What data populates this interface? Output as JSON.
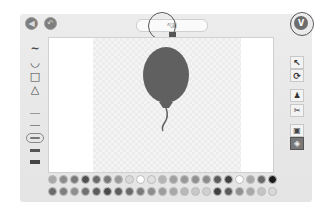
{
  "app": {
    "title_field": {
      "value": "气球"
    },
    "top_buttons": [
      {
        "name": "back-button",
        "icon": "back-icon"
      },
      {
        "name": "undo-button",
        "icon": "undo-icon"
      }
    ],
    "confirm_button": {
      "label": "V",
      "icon": "checkmark-icon"
    }
  },
  "left_tools": [
    {
      "name": "curve-tool",
      "icon": "curve-icon",
      "glyph": "∼"
    },
    {
      "name": "circle-tool",
      "icon": "circle-icon",
      "glyph": "◡"
    },
    {
      "name": "rectangle-tool",
      "icon": "rectangle-icon",
      "glyph": "□"
    },
    {
      "name": "triangle-tool",
      "icon": "triangle-icon",
      "glyph": "△"
    },
    {
      "name": "stroke-thin",
      "icon": "line-thin-icon"
    },
    {
      "name": "stroke-light",
      "icon": "line-light-icon"
    },
    {
      "name": "stroke-selected",
      "icon": "line-medium-icon"
    },
    {
      "name": "stroke-thick",
      "icon": "line-thick-icon"
    },
    {
      "name": "stroke-heavy",
      "icon": "line-heavy-icon"
    }
  ],
  "right_tools": [
    {
      "name": "select-tool",
      "icon": "cursor-icon",
      "glyph": "↖"
    },
    {
      "name": "rotate-tool",
      "icon": "rotate-icon",
      "glyph": "⟳"
    },
    {
      "name": "stamp-tool",
      "icon": "stamp-icon",
      "glyph": "♟"
    },
    {
      "name": "cut-tool",
      "icon": "scissors-icon",
      "glyph": "✂"
    },
    {
      "name": "shrink-tool",
      "icon": "shrink-icon",
      "glyph": "▣"
    },
    {
      "name": "fill-tool",
      "icon": "paint-bucket-icon",
      "glyph": "◈"
    }
  ],
  "canvas": {
    "drawing": "balloon",
    "balloon_color": "#606060"
  },
  "palette": {
    "row1": [
      "#a8a8a8",
      "#8c8c8c",
      "#7a7a7a",
      "#505050",
      "#6a6a6a",
      "#787878",
      "#9a9a9a",
      "#d8d8d8",
      "#ffffff",
      "#e0e0e0",
      "#b4b4b4",
      "#a0a0a0",
      "#989898",
      "#909090",
      "#8c8c8c",
      "#5a5a5a",
      "#404040",
      "#ffffff",
      "#a8a8a8",
      "#6a6a6a",
      "#1a1a1a"
    ],
    "row2": [
      "#6a6a6a",
      "#7e7e7e",
      "#8e8e8e",
      "#707070",
      "#5c5c5c",
      "#4a4a4a",
      "#5e5e5e",
      "#6a6a6a",
      "#7a7a7a",
      "#8c8c8c",
      "#9c9c9c",
      "#a8a8a8",
      "#b8b8b8",
      "#c8c8c8",
      "#d0d0d0",
      "#404040",
      "#5a5a5a",
      "#909090",
      "#a8a8a8",
      "#c4c4c4",
      "#d8d8d8"
    ]
  }
}
